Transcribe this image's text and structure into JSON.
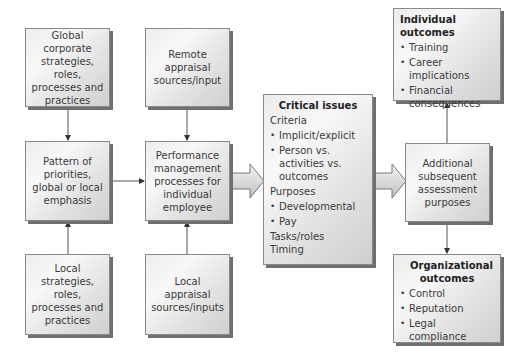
{
  "diagram": {
    "boxes": {
      "global_corporate": {
        "label": "Global corporate strategies, roles, processes and practices"
      },
      "pattern": {
        "label": "Pattern of priorities, global or local emphasis"
      },
      "local_strategies": {
        "label": "Local strategies, roles, processes and practices"
      },
      "remote_appraisal": {
        "label": "Remote appraisal sources/input"
      },
      "performance_mgmt": {
        "label": "Performance management processes for individual employee"
      },
      "local_appraisal": {
        "label": "Local appraisal sources/inputs"
      },
      "critical_issues": {
        "title": "Critical issues",
        "items": [
          {
            "type": "heading",
            "text": "Criteria"
          },
          {
            "type": "bullet",
            "text": "Implicit/explicit"
          },
          {
            "type": "bullet",
            "text": "Person vs. activities vs. outcomes"
          },
          {
            "type": "heading",
            "text": "Purposes"
          },
          {
            "type": "bullet",
            "text": "Developmental"
          },
          {
            "type": "bullet",
            "text": "Pay"
          },
          {
            "type": "heading",
            "text": "Tasks/roles"
          },
          {
            "type": "heading",
            "text": "Timing"
          }
        ]
      },
      "individual_outcomes": {
        "title": "Individual outcomes",
        "bullets": [
          "Training",
          "Career implications",
          "Financial consequences"
        ]
      },
      "additional_assessment": {
        "label": "Additional subsequent assessment purposes"
      },
      "organizational_outcomes": {
        "title": "Organizational outcomes",
        "bullets": [
          "Control",
          "Reputation",
          "Legal compliance"
        ]
      }
    },
    "connections": [
      {
        "from": "global_corporate",
        "to": "pattern",
        "style": "line-arrow"
      },
      {
        "from": "local_strategies",
        "to": "pattern",
        "style": "line-arrow"
      },
      {
        "from": "pattern",
        "to": "performance_mgmt",
        "style": "line-arrow"
      },
      {
        "from": "remote_appraisal",
        "to": "performance_mgmt",
        "style": "line-arrow"
      },
      {
        "from": "local_appraisal",
        "to": "performance_mgmt",
        "style": "line-arrow"
      },
      {
        "from": "performance_mgmt",
        "to": "critical_issues",
        "style": "block-arrow"
      },
      {
        "from": "critical_issues",
        "to": "additional_assessment",
        "style": "block-arrow"
      },
      {
        "from": "additional_assessment",
        "to": "individual_outcomes",
        "style": "line-arrow"
      },
      {
        "from": "additional_assessment",
        "to": "organizational_outcomes",
        "style": "line-arrow"
      }
    ],
    "colors": {
      "box_border": "#8a8a8a",
      "box_shadow": "#6f6f6f",
      "line": "#555555",
      "text": "#3a3a3a"
    }
  }
}
